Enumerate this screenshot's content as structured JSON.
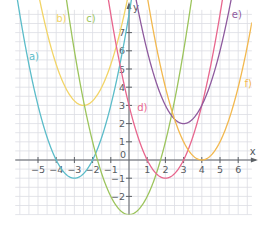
{
  "chart_data": {
    "type": "line",
    "title": "",
    "xlabel": "x",
    "ylabel": "y",
    "xlim": [
      -6.25,
      6.75
    ],
    "ylim": [
      -3,
      8.25
    ],
    "grid": true,
    "grid_step": 0.5,
    "x_ticks": [
      -5,
      -4,
      -3,
      -2,
      -1,
      1,
      2,
      3,
      4,
      5,
      6
    ],
    "y_ticks": [
      -2,
      -1,
      1,
      2,
      3,
      4,
      5,
      6,
      7
    ],
    "origin_label": "0",
    "series": [
      {
        "name": "a)",
        "equation": "y = (x + 3)^2 - 1",
        "h": -3,
        "k": -1,
        "a": 1,
        "color": "#5bbcc9",
        "label_pos": [
          -5.5,
          5.5
        ]
      },
      {
        "name": "b)",
        "equation": "y = (x + 2.5)^2 + 3",
        "h": -2.5,
        "k": 3,
        "a": 1,
        "color": "#f2d466",
        "label_pos": [
          -4.0,
          7.6
        ]
      },
      {
        "name": "c)",
        "equation": "y = x^2 - 3",
        "h": 0,
        "k": -3,
        "a": 1,
        "color": "#9cc45c",
        "label_pos": [
          -2.35,
          7.6
        ]
      },
      {
        "name": "d)",
        "equation": "y = (x - 2)^2 - 1",
        "h": 2,
        "k": -1,
        "a": 1,
        "color": "#e8668e",
        "label_pos": [
          0.45,
          2.7
        ]
      },
      {
        "name": "e)",
        "equation": "y = (x - 3)^2 + 2",
        "h": 3,
        "k": 2,
        "a": 1,
        "color": "#8e5a9e",
        "label_pos": [
          5.65,
          7.8
        ]
      },
      {
        "name": "f)",
        "equation": "y = (x - 4)^2",
        "h": 4,
        "k": 0,
        "a": 1,
        "color": "#f2b84e",
        "label_pos": [
          6.35,
          4.0
        ]
      }
    ]
  },
  "axes": {
    "x_name": "x",
    "y_name": "y",
    "color": "#5c6166",
    "grid_color": "#dcdde3"
  }
}
